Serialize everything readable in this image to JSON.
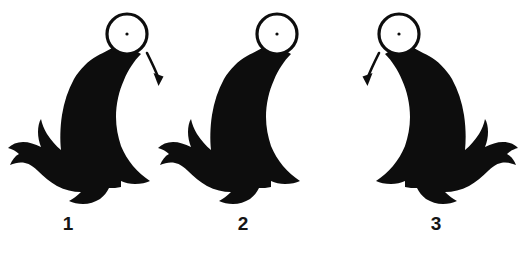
{
  "figure": {
    "background_color": "#ffffff",
    "ink_color": "#0d0d0d",
    "ball_fill_color": "#ffffff",
    "width": 520,
    "height": 254,
    "panels": [
      {
        "number": "1",
        "number_x": 68,
        "number_y": 230,
        "seal": {
          "name": "seal-silhouette",
          "facing": "right",
          "offset_x": 0,
          "mirrored": false
        },
        "ball": {
          "name": "balanced-ball",
          "cx": 127,
          "cy": 34,
          "r": 20,
          "stroke_width": 3.2,
          "center_dot_r": 1.6
        },
        "arrow": {
          "name": "motion-arrow",
          "present": true,
          "direction": "down-right",
          "start_x": 147,
          "start_y": 53,
          "end_x": 160,
          "end_y": 84
        }
      },
      {
        "number": "2",
        "number_x": 243,
        "number_y": 230,
        "seal": {
          "name": "seal-silhouette",
          "facing": "right",
          "offset_x": 150,
          "mirrored": false
        },
        "ball": {
          "name": "balanced-ball",
          "cx": 277,
          "cy": 34,
          "r": 20,
          "stroke_width": 3.2,
          "center_dot_r": 1.6
        },
        "arrow": {
          "name": "motion-arrow",
          "present": false,
          "direction": "none",
          "start_x": 0,
          "start_y": 0,
          "end_x": 0,
          "end_y": 0
        }
      },
      {
        "number": "3",
        "number_x": 436,
        "number_y": 230,
        "seal": {
          "name": "seal-silhouette",
          "facing": "left",
          "offset_x": 0,
          "mirrored": true
        },
        "ball": {
          "name": "balanced-ball",
          "cx": 399,
          "cy": 34,
          "r": 20,
          "stroke_width": 3.2,
          "center_dot_r": 1.6
        },
        "arrow": {
          "name": "motion-arrow",
          "present": true,
          "direction": "down-left",
          "start_x": 379,
          "start_y": 53,
          "end_x": 366,
          "end_y": 84
        }
      }
    ]
  }
}
